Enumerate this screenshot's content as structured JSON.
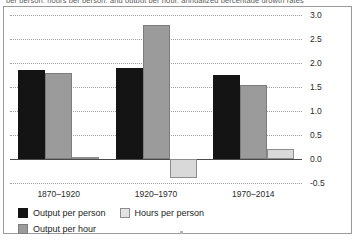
{
  "caption_clipped": "per person, hours per person, and output per hour, annualized percentage growth rates",
  "chart_data": {
    "type": "bar",
    "title": "",
    "subtitle": "",
    "xlabel": "",
    "ylabel": "",
    "categories": [
      "1870–1920",
      "1920–1970",
      "1970–2014"
    ],
    "series": [
      {
        "name": "Output per person",
        "color": "#141414",
        "values": [
          1.85,
          1.9,
          1.75
        ]
      },
      {
        "name": "Output per hour",
        "color": "#9b9b9b",
        "values": [
          1.8,
          2.8,
          1.55
        ]
      },
      {
        "name": "Hours per person",
        "color": "#e3e3e3",
        "values": [
          0.05,
          -0.4,
          0.2
        ]
      }
    ],
    "ylim": [
      -0.5,
      3.0
    ],
    "yticks": [
      3.0,
      2.5,
      2.0,
      1.5,
      1.0,
      0.5,
      0.0,
      -0.5
    ],
    "ytick_labels": [
      "3.0",
      "2.5",
      "2.0",
      "1.5",
      "1.0",
      "0.5",
      "0.0",
      "-0.5"
    ],
    "grid": true,
    "grid_style": "dotted",
    "legend_position": "bottom-left",
    "legend_order": [
      "Output per person",
      "Hours per person",
      "Output per hour"
    ],
    "annotations": []
  }
}
